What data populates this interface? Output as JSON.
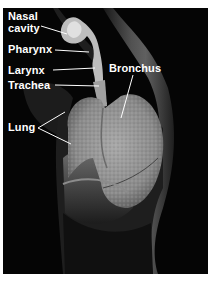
{
  "figure": {
    "background_color": "#050505",
    "label_color": "#ffffff",
    "labels": [
      {
        "id": "nasal-cavity",
        "line1": "Nasal",
        "line2": "cavity"
      },
      {
        "id": "pharynx",
        "text": "Pharynx"
      },
      {
        "id": "larynx",
        "text": "Larynx"
      },
      {
        "id": "trachea",
        "text": "Trachea"
      },
      {
        "id": "bronchus",
        "text": "Bronchus"
      },
      {
        "id": "lung",
        "text": "Lung"
      }
    ]
  }
}
